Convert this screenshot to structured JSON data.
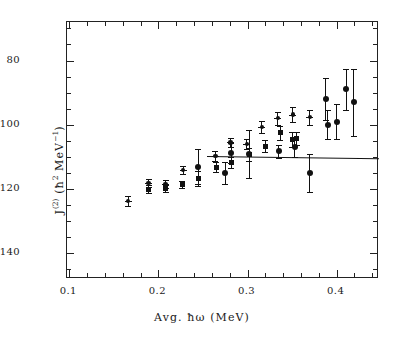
{
  "figure": {
    "background_color": "#ffffff",
    "foreground_color": "#111111"
  },
  "axes": {
    "x_title_prefix": "Avg. ",
    "x_title_symbol": "ħω",
    "x_title_unit": " (MeV)",
    "x_title_full": "Avg. ħω (MeV)",
    "y_title_main": "J",
    "y_title_sup": "(2)",
    "y_title_unit_open": " (",
    "y_title_hbar": "ħ",
    "y_title_hbar_sup": "2",
    "y_title_mev": " MeV",
    "y_title_mev_sup": "−1",
    "y_title_close": ")",
    "y_title_full": "J(2) (ħ² MeV⁻¹)",
    "x_ticks": [
      "0.1",
      "0.2",
      "0.3",
      "0.4"
    ],
    "y_ticks": [
      "140",
      "120",
      "100",
      "80"
    ]
  },
  "chart_data": {
    "type": "scatter",
    "title": "",
    "xlabel": "Avg. ħω (MeV)",
    "ylabel": "J(2) (ħ² MeV⁻¹)",
    "xlim": [
      0.0975,
      0.4475
    ],
    "ylim": [
      72,
      152
    ],
    "xticks": [
      0.1,
      0.2,
      0.3,
      0.4
    ],
    "yticks": [
      80,
      100,
      120,
      140
    ],
    "x_minor_step": 0.02,
    "y_minor_step": 5,
    "grid": false,
    "legend": false,
    "series": [
      {
        "name": "band-1-cross",
        "marker": "cross",
        "points": [
          {
            "x": 0.166,
            "y": 96.3,
            "yerr": 1.6
          },
          {
            "x": 0.189,
            "y": 101.8,
            "yerr": 1.3
          },
          {
            "x": 0.208,
            "y": 101.5,
            "yerr": 1.3
          },
          {
            "x": 0.228,
            "y": 106.0,
            "yerr": 1.2
          },
          {
            "x": 0.264,
            "y": 110.2,
            "yerr": 1.5
          },
          {
            "x": 0.281,
            "y": 114.5,
            "yerr": 1.4
          },
          {
            "x": 0.299,
            "y": 114.0,
            "yerr": 1.5
          },
          {
            "x": 0.316,
            "y": 119.3,
            "yerr": 1.8
          },
          {
            "x": 0.334,
            "y": 122.0,
            "yerr": 2.0
          },
          {
            "x": 0.351,
            "y": 123.2,
            "yerr": 2.2
          },
          {
            "x": 0.37,
            "y": 122.3,
            "yerr": 2.3
          }
        ]
      },
      {
        "name": "band-2-square",
        "marker": "square",
        "points": [
          {
            "x": 0.189,
            "y": 100.0,
            "yerr": 1.2
          },
          {
            "x": 0.208,
            "y": 100.2,
            "yerr": 1.2
          },
          {
            "x": 0.227,
            "y": 101.4,
            "yerr": 1.2
          },
          {
            "x": 0.245,
            "y": 103.3,
            "yerr": 2.4
          },
          {
            "x": 0.265,
            "y": 106.8,
            "yerr": 1.6
          },
          {
            "x": 0.282,
            "y": 108.3,
            "yerr": 1.6
          },
          {
            "x": 0.302,
            "y": 110.8,
            "yerr": 2.0
          },
          {
            "x": 0.32,
            "y": 113.3,
            "yerr": 1.9
          },
          {
            "x": 0.337,
            "y": 117.5,
            "yerr": 2.2
          },
          {
            "x": 0.35,
            "y": 115.4,
            "yerr": 2.3
          },
          {
            "x": 0.355,
            "y": 115.8,
            "yerr": 2.0
          }
        ]
      },
      {
        "name": "band-3-circle",
        "marker": "circle",
        "points": [
          {
            "x": 0.245,
            "y": 107.0,
            "yerr": 5.5
          },
          {
            "x": 0.275,
            "y": 105.0,
            "yerr": 3.5
          },
          {
            "x": 0.282,
            "y": 111.2,
            "yerr": 3.2
          },
          {
            "x": 0.302,
            "y": 110.9,
            "yerr": 7.5
          },
          {
            "x": 0.335,
            "y": 111.7,
            "yerr": 2.0
          },
          {
            "x": 0.353,
            "y": 113.0,
            "yerr": 3.0
          },
          {
            "x": 0.37,
            "y": 105.0,
            "yerr": 6.0
          },
          {
            "x": 0.388,
            "y": 128.0,
            "yerr": 6.5
          },
          {
            "x": 0.39,
            "y": 120.0,
            "yerr": 4.5
          },
          {
            "x": 0.4,
            "y": 121.0,
            "yerr": 5.5
          },
          {
            "x": 0.411,
            "y": 131.0,
            "yerr": 6.5
          },
          {
            "x": 0.419,
            "y": 127.0,
            "yerr": 10.5
          }
        ]
      }
    ],
    "reference_line": {
      "name": "model-line",
      "y_start": 110.2,
      "y_end": 109.5,
      "x_start": 0.255,
      "x_end": 0.4475
    }
  }
}
